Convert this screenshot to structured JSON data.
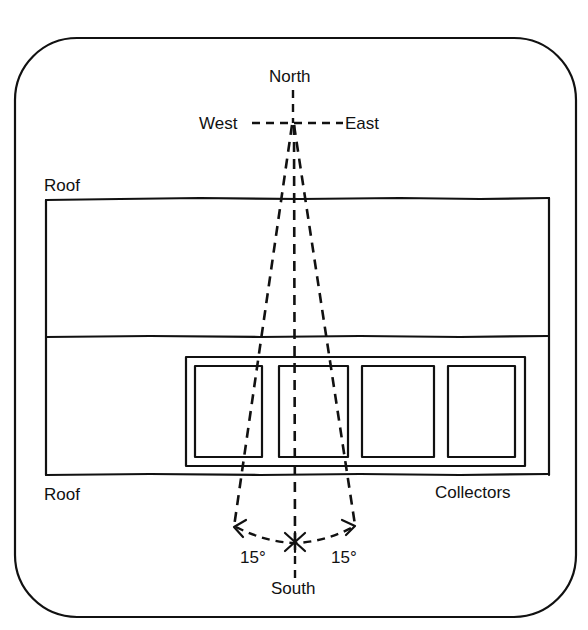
{
  "diagram": {
    "type": "solar collector orientation plan view",
    "compass": {
      "north": "North",
      "south": "South",
      "east": "East",
      "west": "West"
    },
    "labels": {
      "roof_top": "Roof",
      "roof_bottom": "Roof",
      "collectors": "Collectors"
    },
    "angles": {
      "left": "15°",
      "right": "15°"
    },
    "collector_count": 4,
    "colors": {
      "ink": "#111111",
      "background": "#ffffff"
    }
  }
}
